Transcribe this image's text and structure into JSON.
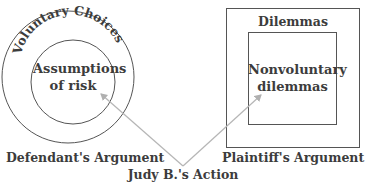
{
  "diagram": {
    "left": {
      "outer_label": "Voluntary Choices",
      "inner_label_line1": "Assumptions",
      "inner_label_line2": "of risk",
      "caption": "Defendant's Argument"
    },
    "right": {
      "outer_label": "Dilemmas",
      "inner_label_line1": "Nonvoluntary",
      "inner_label_line2": "dilemmas",
      "caption": "Plaintiff's Argument"
    },
    "center_label": "Judy B.'s Action",
    "colors": {
      "shape_stroke": "#555555",
      "arrow_stroke": "#b5b5b5",
      "text": "#3c3c3c"
    }
  }
}
